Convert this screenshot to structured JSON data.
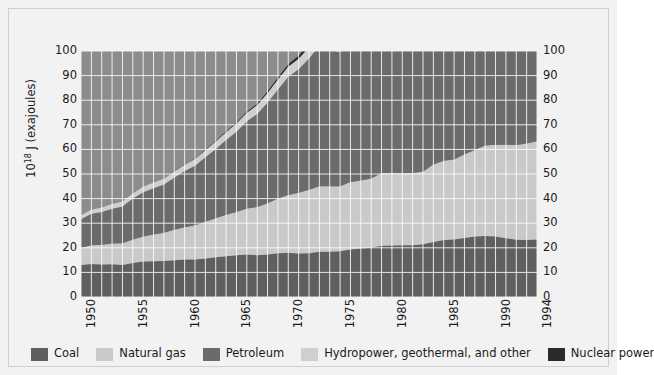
{
  "chart_data": {
    "type": "area",
    "title": "",
    "xlabel": "",
    "ylabel": "10^18 J (exajoules)",
    "ylabel_mantissa": "10",
    "ylabel_exponent": "18",
    "ylabel_rest": " J (exajoules)",
    "stacked": true,
    "grid": true,
    "legend_position": "bottom",
    "xlim": [
      1950,
      1994
    ],
    "ylim": [
      0,
      100
    ],
    "ytick_values": [
      0,
      10,
      20,
      30,
      40,
      50,
      60,
      70,
      80,
      90,
      100
    ],
    "ytick_labels": [
      "0",
      "10",
      "20",
      "30",
      "40",
      "50",
      "60",
      "70",
      "80",
      "90",
      "100"
    ],
    "xtick_values": [
      1950,
      1955,
      1960,
      1965,
      1970,
      1975,
      1980,
      1985,
      1990,
      1994
    ],
    "xtick_labels": [
      "1950",
      "1955",
      "1960",
      "1965",
      "1970",
      "1975",
      "1980",
      "1985",
      "1990",
      "1994"
    ],
    "x": [
      1950,
      1951,
      1952,
      1953,
      1954,
      1955,
      1956,
      1957,
      1958,
      1959,
      1960,
      1961,
      1962,
      1963,
      1964,
      1965,
      1966,
      1967,
      1968,
      1969,
      1970,
      1971,
      1972,
      1973,
      1974,
      1975,
      1976,
      1977,
      1978,
      1979,
      1980,
      1981,
      1982,
      1983,
      1984,
      1985,
      1986,
      1987,
      1988,
      1989,
      1990,
      1991,
      1992,
      1993,
      1994
    ],
    "series": [
      {
        "name": "Coal",
        "color": "#5f5f5f",
        "values": [
          13.0,
          13.4,
          13.2,
          13.3,
          13.0,
          13.8,
          14.4,
          14.5,
          14.6,
          14.9,
          15.2,
          15.2,
          15.6,
          16.2,
          16.6,
          17.0,
          17.3,
          17.0,
          17.3,
          17.8,
          18.0,
          17.7,
          17.8,
          18.4,
          18.4,
          18.6,
          19.3,
          19.7,
          20.0,
          20.8,
          20.9,
          21.0,
          21.0,
          21.4,
          22.4,
          23.2,
          23.4,
          24.0,
          24.6,
          24.8,
          24.6,
          23.9,
          23.3,
          23.2,
          23.4
        ]
      },
      {
        "name": "Natural gas",
        "color": "#c9c9c9",
        "values": [
          7.0,
          7.6,
          8.0,
          8.4,
          8.8,
          9.6,
          10.2,
          10.9,
          11.5,
          12.4,
          13.2,
          14.0,
          15.0,
          15.8,
          16.8,
          17.6,
          18.7,
          19.6,
          20.8,
          22.2,
          23.5,
          24.7,
          25.8,
          26.6,
          26.6,
          26.4,
          27.4,
          27.7,
          28.2,
          29.6,
          29.5,
          29.4,
          29.4,
          29.6,
          31.5,
          32.2,
          32.5,
          34.0,
          35.2,
          36.8,
          37.3,
          38.0,
          38.5,
          39.2,
          39.9
        ]
      },
      {
        "name": "Petroleum",
        "color": "#6b6b6b",
        "values": [
          11.6,
          12.8,
          13.4,
          14.2,
          15.0,
          16.6,
          18.0,
          18.8,
          19.6,
          21.2,
          22.8,
          24.2,
          26.2,
          28.2,
          30.4,
          32.6,
          35.4,
          37.8,
          41.0,
          44.4,
          48.0,
          50.2,
          53.4,
          57.0,
          55.4,
          54.6,
          58.2,
          60.2,
          61.8,
          63.2,
          60.6,
          57.8,
          55.6,
          55.0,
          56.2,
          56.2,
          58.2,
          59.4,
          61.4,
          62.2,
          62.8,
          62.6,
          63.4,
          63.8,
          65.0
        ]
      },
      {
        "name": "Hydropower, geothermal, and other",
        "color": "#cfcfcf",
        "values": [
          1.6,
          1.7,
          1.8,
          1.9,
          2.0,
          2.1,
          2.2,
          2.3,
          2.4,
          2.5,
          2.6,
          2.7,
          2.9,
          3.0,
          3.2,
          3.3,
          3.5,
          3.6,
          3.8,
          4.0,
          4.2,
          4.3,
          4.5,
          4.6,
          4.9,
          5.0,
          5.1,
          5.2,
          5.5,
          5.7,
          5.9,
          6.0,
          6.1,
          6.4,
          6.7,
          6.9,
          7.0,
          7.2,
          7.4,
          7.4,
          7.8,
          7.9,
          7.9,
          8.2,
          8.2
        ]
      },
      {
        "name": "Nuclear power",
        "color": "#2b2b2b",
        "values": [
          0.0,
          0.0,
          0.0,
          0.0,
          0.0,
          0.0,
          0.0,
          0.0,
          0.0,
          0.1,
          0.1,
          0.1,
          0.2,
          0.2,
          0.3,
          0.3,
          0.4,
          0.5,
          0.6,
          0.8,
          0.9,
          1.2,
          1.5,
          2.0,
          2.4,
          3.1,
          3.5,
          4.2,
          4.7,
          5.0,
          5.6,
          6.5,
          7.0,
          7.9,
          9.4,
          10.5,
          11.1,
          12.0,
          12.9,
          13.3,
          13.8,
          14.2,
          14.3,
          14.6,
          15.0
        ]
      }
    ]
  },
  "axes": {
    "ylabel_mantissa": "10",
    "ylabel_exponent": "18",
    "ylabel_rest": " J (exajoules)"
  },
  "style": {
    "plot_background": "#8c8c8c",
    "figure_background": "#f2f2f2",
    "gridline_color": "#ffffff",
    "text_color": "#1a1a1a",
    "frame_border": "#cfcfcf"
  }
}
